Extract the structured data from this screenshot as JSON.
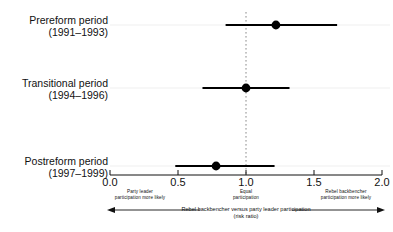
{
  "chart_data": {
    "type": "scatter",
    "subtype": "forest-plot",
    "title": "",
    "xlabel": "Rebel backbencher versus party leader participation (risk ratio)",
    "ylabel": "",
    "xlim": [
      0.0,
      2.0
    ],
    "xticks": [
      0.0,
      0.5,
      1.0,
      1.5,
      2.0
    ],
    "xtick_labels": [
      "0.0",
      "0.5",
      "1.0",
      "1.5",
      "2.0"
    ],
    "grid": false,
    "reference_line": 1.0,
    "legend": "none",
    "categories": [
      "Prereform period (1991–1993)",
      "Transitional period (1994–1996)",
      "Postreform period (1997–1999)"
    ],
    "values": [
      1.22,
      1.0,
      0.78
    ],
    "ci_low": [
      0.85,
      0.68,
      0.48
    ],
    "ci_high": [
      1.67,
      1.32,
      1.21
    ],
    "series": [
      {
        "name": "Risk ratio with 95% confidence interval",
        "points": [
          {
            "category": "Prereform period (1991–1993)",
            "estimate": 1.22,
            "ci_low": 0.85,
            "ci_high": 1.67
          },
          {
            "category": "Transitional period (1994–1996)",
            "estimate": 1.0,
            "ci_low": 0.68,
            "ci_high": 1.32
          },
          {
            "category": "Postreform period (1997–1999)",
            "estimate": 0.78,
            "ci_low": 0.48,
            "ci_high": 1.21
          }
        ]
      }
    ]
  },
  "rows": [
    {
      "name": "Prereform period",
      "years": "(1991–1993)"
    },
    {
      "name": "Transitional period",
      "years": "(1994–1996)"
    },
    {
      "name": "Postreform period",
      "years": "(1997–1999)"
    }
  ],
  "axis": {
    "ticks": [
      "0.0",
      "0.5",
      "1.0",
      "1.5",
      "2.0"
    ]
  },
  "annotations": {
    "left_line1": "Party leader",
    "left_line2": "participation more likely",
    "center_line1": "Equal",
    "center_line2": "participation",
    "right_line1": "Rebel backbencher",
    "right_line2": "participation more likely"
  },
  "caption": {
    "line1": "Rebel backbencher versus party leader participation",
    "line2": "(risk ratio)"
  },
  "colors": {
    "ink": "#111111",
    "marker": "#000000",
    "reference": "#777777",
    "rowline": "#ededed"
  }
}
